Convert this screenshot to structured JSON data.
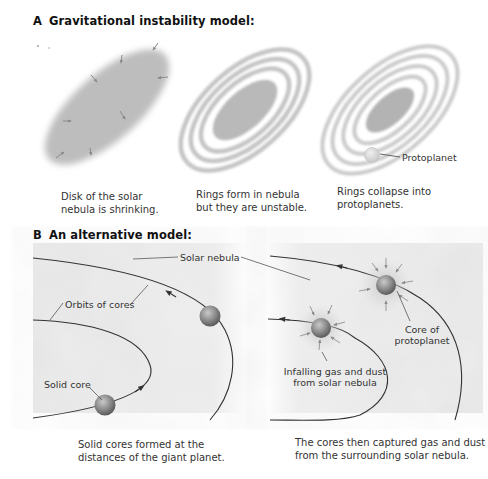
{
  "panel_a": {
    "letter": "A",
    "title": "Gravitational instability model:",
    "stages": [
      {
        "caption": "Disk of the solar\nnebula is shrinking."
      },
      {
        "caption": "Rings form in nebula\nbut they are unstable."
      },
      {
        "caption": "Rings collapse into\nprotoplanets."
      }
    ],
    "labels": {
      "protoplanet": "Protoplanet"
    }
  },
  "panel_b": {
    "letter": "B",
    "title": "An alternative model:",
    "left": {
      "labels": {
        "solar_nebula": "Solar nebula",
        "orbits_of_cores": "Orbits of cores",
        "solid_core": "Solid core"
      },
      "caption": "Solid cores formed at the\ndistances of the giant planet."
    },
    "right": {
      "labels": {
        "core_of_protoplanet": "Core of\nprotoplanet",
        "infalling": "Infalling gas and dust\nfrom solar nebula"
      },
      "caption": "The cores then captured gas and dust\nfrom the surrounding solar nebula."
    }
  },
  "colors": {
    "nebula_gray": "#b8b8b8",
    "ring_gray": "#c4c4c4",
    "core_fill": "#8a8a8a",
    "orbit_line": "#333333",
    "background_cloud": "#e6e6e6"
  }
}
